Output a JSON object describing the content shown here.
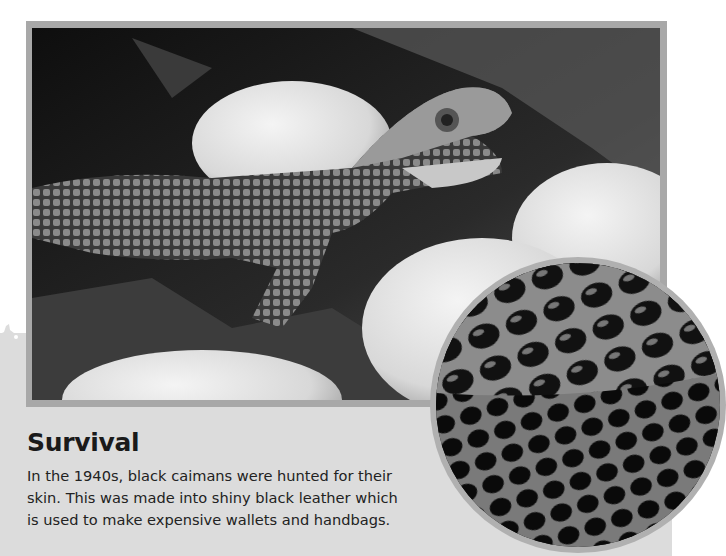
{
  "page": {
    "background": "#ffffff",
    "panel_color": "#dcdcdc"
  },
  "main_photo": {
    "subject": "baby black caiman hatching among white eggs",
    "icon": "photo-image",
    "style": "grayscale"
  },
  "inset_photo": {
    "subject": "close-up of black caiman skin / leather texture",
    "icon": "photo-image",
    "shape": "circle"
  },
  "caption": {
    "title": "Survival",
    "lines": [
      "In the 1940s, black caimans were hunted for their",
      "skin. This was made into shiny black leather which",
      "is used to make expensive wallets and handbags."
    ]
  }
}
